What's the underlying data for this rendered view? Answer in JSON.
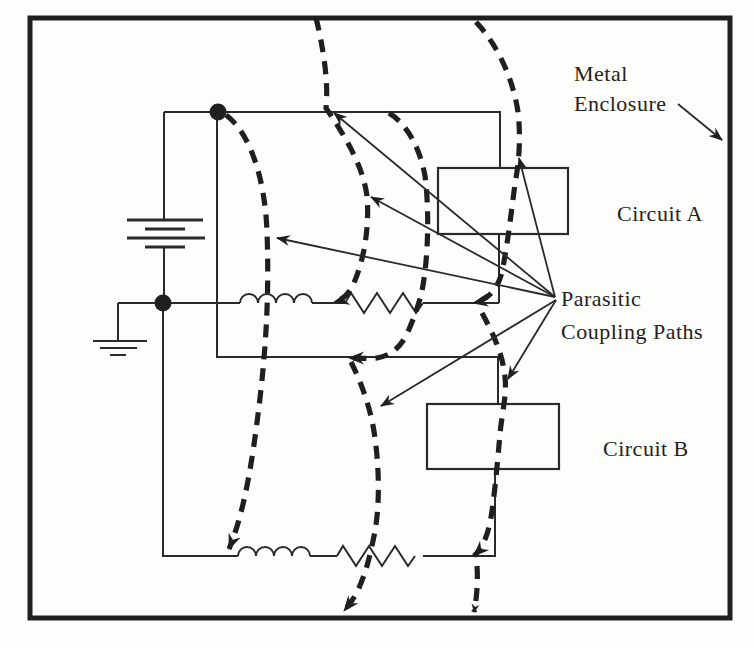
{
  "figure": {
    "description_colors": {
      "ink": "#1f1f1d",
      "background": "#fdfdfb"
    },
    "labels": {
      "metal_enclosure": {
        "line1": "Metal",
        "line2": "Enclosure"
      },
      "circuit_a": "Circuit A",
      "circuit_b": "Circuit B",
      "parasitic": {
        "line1": "Parasitic",
        "line2": "Coupling Paths"
      }
    }
  }
}
